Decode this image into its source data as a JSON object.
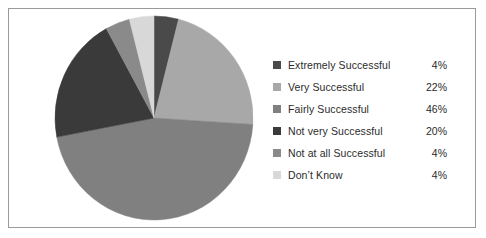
{
  "chart_data": {
    "type": "pie",
    "title": "",
    "subtitle": "",
    "xlabel": "",
    "ylabel": "",
    "legend_position": "right",
    "grid": false,
    "start_angle_deg": 0,
    "direction": "clockwise",
    "categories": [
      "Extremely Successful",
      "Very Successful",
      "Fairly Successful",
      "Not very Successful",
      "Not at all Successful",
      "Don’t Know"
    ],
    "values": [
      4,
      22,
      46,
      20,
      4,
      4
    ],
    "value_labels": [
      "4%",
      "22%",
      "46%",
      "20%",
      "4%",
      "4%"
    ],
    "unit": "%",
    "colors": [
      "#4a4a4a",
      "#a8a8a8",
      "#808080",
      "#3a3a3a",
      "#8a8a8a",
      "#d8d8d8"
    ],
    "slices": [
      {
        "label": "Extremely Successful",
        "value": 4,
        "value_label": "4%",
        "color": "#4a4a4a"
      },
      {
        "label": "Very Successful",
        "value": 22,
        "value_label": "22%",
        "color": "#a8a8a8"
      },
      {
        "label": "Fairly Successful",
        "value": 46,
        "value_label": "46%",
        "color": "#808080"
      },
      {
        "label": "Not very Successful",
        "value": 20,
        "value_label": "20%",
        "color": "#3a3a3a"
      },
      {
        "label": "Not at all Successful",
        "value": 4,
        "value_label": "4%",
        "color": "#8a8a8a"
      },
      {
        "label": "Don’t Know",
        "value": 4,
        "value_label": "4%",
        "color": "#d8d8d8"
      }
    ]
  },
  "legend": {
    "rows": [
      {
        "label": "Extremely Successful",
        "value": "4%",
        "color": "#4a4a4a"
      },
      {
        "label": "Very Successful",
        "value": "22%",
        "color": "#a8a8a8"
      },
      {
        "label": "Fairly Successful",
        "value": "46%",
        "color": "#808080"
      },
      {
        "label": "Not very Successful",
        "value": "20%",
        "color": "#3a3a3a"
      },
      {
        "label": "Not at all Successful",
        "value": "4%",
        "color": "#8a8a8a"
      },
      {
        "label": "Don’t Know",
        "value": "4%",
        "color": "#d8d8d8"
      }
    ]
  },
  "style": {
    "background": "#ffffff",
    "border_color": "#9a9a9a",
    "text_color": "#2b2b2b"
  }
}
